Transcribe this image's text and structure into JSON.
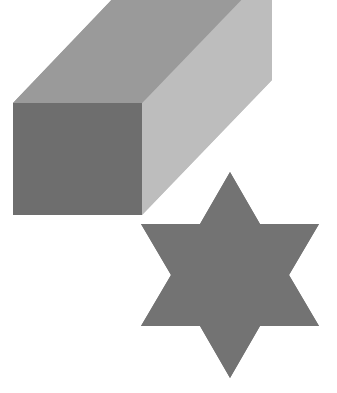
{
  "canvas": {
    "width": 337,
    "height": 393,
    "background_color": "#ffffff",
    "title": "Isometric cube and six-pointed star"
  },
  "palette": {
    "background": "#ffffff",
    "cube_top_face": "#9a9a9a",
    "cube_right_face": "#bdbdbd",
    "cube_left_face": "#6e6e6e",
    "star_fill": "#737373"
  },
  "shapes": [
    {
      "id": "cube",
      "name": "isometric-cube",
      "label": "Cube",
      "z_order": 2,
      "faces": [
        {
          "id": "cube-top-face",
          "name": "cube-top-face",
          "label": "Top face",
          "color_key": "cube_top_face",
          "color": "#9a9a9a",
          "points": "13,103 142,-32 272,-32 142,103"
        },
        {
          "id": "cube-right-face",
          "name": "cube-right-face",
          "label": "Right face",
          "color_key": "cube_right_face",
          "color": "#bdbdbd",
          "points": "142,103 272,-32 272,80 142,215"
        },
        {
          "id": "cube-left-face",
          "name": "cube-left-face",
          "label": "Left face",
          "color_key": "cube_left_face",
          "color": "#6e6e6e",
          "points": "13,103 142,103 142,215 13,215"
        }
      ],
      "vertices": {
        "left": [
          13,
          103
        ],
        "center": [
          142,
          103
        ],
        "right": [
          263,
          102
        ],
        "bottom_left": [
          48,
          215
        ],
        "bottom_center": [
          142,
          215
        ]
      }
    },
    {
      "id": "star",
      "name": "six-pointed-star",
      "label": "Six-pointed star",
      "z_order": 1,
      "color_key": "star_fill",
      "color": "#737373",
      "center": [
        230,
        275
      ],
      "outer_radius": 103,
      "inner_radius": 59,
      "point_count": 6,
      "rotation_degrees": 30,
      "points": "230,172 260,224 319,224 289,275 319,326 260,326 230,378 200,326 141,326 171,275 141,224 200,224"
    }
  ]
}
